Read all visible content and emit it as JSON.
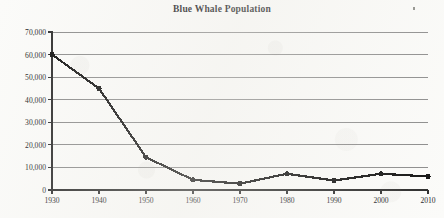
{
  "chart_data": {
    "type": "line",
    "title": "Blue Whale Population",
    "xlabel": "",
    "ylabel": "",
    "x": [
      1930,
      1940,
      1950,
      1960,
      1970,
      1980,
      1990,
      2000,
      2010
    ],
    "values": [
      60000,
      45000,
      14500,
      4500,
      2800,
      7200,
      4200,
      7200,
      6000
    ],
    "series": [
      {
        "name": "Blue Whale Population",
        "values": [
          60000,
          45000,
          14500,
          4500,
          2800,
          7200,
          4200,
          7200,
          6000
        ]
      }
    ],
    "xtick_labels": [
      "1930",
      "1940",
      "1950",
      "1960",
      "1970",
      "1980",
      "1990",
      "2000",
      "2010"
    ],
    "ytick_values": [
      0,
      10000,
      20000,
      30000,
      40000,
      50000,
      60000,
      70000
    ],
    "ytick_labels": [
      "0",
      "10,000",
      "20,000",
      "30,000",
      "40,000",
      "50,000",
      "60,000",
      "70,000"
    ],
    "xlim": [
      1930,
      2010
    ],
    "ylim": [
      0,
      70000
    ],
    "grid": "horizontal",
    "legend": "none",
    "line_color": "#111111",
    "marker": "circle",
    "marker_color": "#111111",
    "gridline_color": "#8b8b8b",
    "axis_color": "#2b2b2b",
    "background_color": "#fbfbf9"
  },
  "artifacts": {
    "speck_label": "scan-speck"
  }
}
